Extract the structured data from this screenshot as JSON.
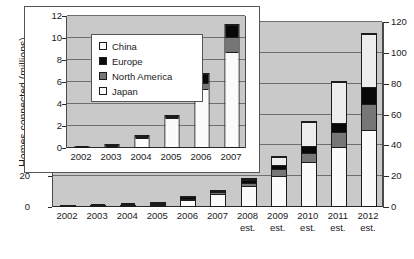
{
  "chart_data": {
    "type": "bar",
    "title": "",
    "subtitle": "",
    "ylabel": "Homes connected (millions)",
    "xlabel": "",
    "stacked": true,
    "grid": true,
    "legend_position": "inside-inset-upper-left",
    "categories": [
      "2002",
      "2003",
      "2004",
      "2005",
      "2006",
      "2007",
      "2008",
      "2009",
      "2010",
      "2011",
      "2012"
    ],
    "category_notes": [
      "",
      "",
      "",
      "",
      "",
      "",
      "est.",
      "est.",
      "est.",
      "est.",
      "est."
    ],
    "ylim": [
      0,
      120
    ],
    "yticks": [
      0,
      20,
      40,
      60,
      80,
      100,
      120
    ],
    "right_axis": {
      "ylim": [
        0,
        120
      ],
      "yticks": [
        0,
        20,
        40,
        60,
        80,
        100,
        120
      ],
      "ticklabels": [
        "0",
        "20",
        "40",
        "60",
        "80",
        "100",
        "120"
      ]
    },
    "left_axis": {
      "visible_ticklabels": [
        "0",
        "20"
      ],
      "note": "upper left tick labels are hidden behind the inset panel"
    },
    "series": [
      {
        "name": "Japan",
        "color": "#fbfbfb",
        "values": [
          0.08,
          0.3,
          1.1,
          2.9,
          5.4,
          8.8,
          14.0,
          20.5,
          29.0,
          39.0,
          50.0
        ]
      },
      {
        "name": "North America",
        "color": "#767676",
        "values": [
          0.0,
          0.0,
          0.05,
          0.05,
          0.6,
          1.4,
          2.0,
          4.5,
          6.5,
          9.5,
          17.0
        ]
      },
      {
        "name": "Europe",
        "color": "#080808",
        "values": [
          0.0,
          0.05,
          0.05,
          0.05,
          0.85,
          1.1,
          2.5,
          2.5,
          4.5,
          6.5,
          11.0
        ]
      },
      {
        "name": "China",
        "color": "#ededed",
        "values": [
          0.0,
          0.0,
          0.0,
          0.0,
          0.0,
          0.0,
          0.5,
          5.5,
          16.0,
          27.0,
          35.0
        ]
      }
    ],
    "totals": [
      0.08,
      0.35,
      1.2,
      3.0,
      6.85,
      11.3,
      19.0,
      33.0,
      56.0,
      82.0,
      113.0
    ],
    "inset": {
      "description": "Magnified view of 2002-2007",
      "categories": [
        "2002",
        "2003",
        "2004",
        "2005",
        "2006",
        "2007"
      ],
      "ylim": [
        0,
        12
      ],
      "yticks": [
        0,
        2,
        4,
        6,
        8,
        10,
        12
      ],
      "yticklabels": [
        "0",
        "2",
        "4",
        "6",
        "8",
        "10",
        "12"
      ],
      "series": [
        {
          "name": "Japan",
          "values": [
            0.08,
            0.3,
            1.1,
            2.9,
            5.4,
            8.8
          ]
        },
        {
          "name": "North America",
          "values": [
            0.0,
            0.0,
            0.05,
            0.05,
            0.6,
            1.4
          ]
        },
        {
          "name": "Europe",
          "values": [
            0.0,
            0.05,
            0.05,
            0.05,
            0.85,
            1.1
          ]
        },
        {
          "name": "China",
          "values": [
            0.0,
            0.0,
            0.0,
            0.0,
            0.0,
            0.0
          ]
        }
      ],
      "totals": [
        0.08,
        0.35,
        1.2,
        3.0,
        6.85,
        11.3
      ]
    },
    "legend": [
      {
        "label": "China",
        "color": "#ededed"
      },
      {
        "label": "Europe",
        "color": "#080808"
      },
      {
        "label": "North America",
        "color": "#767676"
      },
      {
        "label": "Japan",
        "color": "#fbfbfb"
      }
    ]
  }
}
